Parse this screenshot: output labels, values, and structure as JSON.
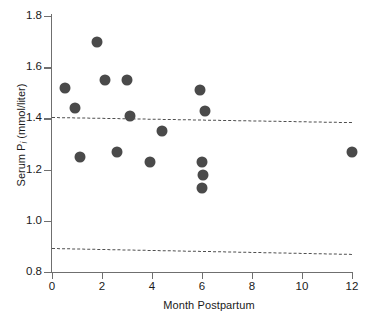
{
  "chart_data": {
    "type": "scatter",
    "title": "",
    "xlabel": "Month Postpartum",
    "ylabel": "Serum Pi (mmol/liter)",
    "ylabel_main": "Serum P",
    "ylabel_sub": "i",
    "ylabel_unit": " (mmol/liter)",
    "xlim": [
      0,
      12
    ],
    "ylim": [
      0.8,
      1.8
    ],
    "xticks": [
      0,
      2,
      4,
      6,
      8,
      10,
      12
    ],
    "xtick_labels": [
      "0",
      "2",
      "4",
      "6",
      "8",
      "10",
      "12"
    ],
    "yticks": [
      0.8,
      1.0,
      1.2,
      1.4,
      1.6,
      1.8
    ],
    "ytick_labels": [
      "0.8",
      "1.0",
      "1.2",
      "1.4",
      "1.6",
      "1.8"
    ],
    "grid": false,
    "legend": "none",
    "marker": {
      "shape": "circle",
      "color": "#4a4a4a",
      "size": 11
    },
    "points": [
      {
        "x": 0.5,
        "y": 1.52
      },
      {
        "x": 0.9,
        "y": 1.44
      },
      {
        "x": 1.1,
        "y": 1.25
      },
      {
        "x": 1.8,
        "y": 1.7
      },
      {
        "x": 2.1,
        "y": 1.55
      },
      {
        "x": 2.6,
        "y": 1.27
      },
      {
        "x": 3.0,
        "y": 1.55
      },
      {
        "x": 3.1,
        "y": 1.41
      },
      {
        "x": 3.9,
        "y": 1.23
      },
      {
        "x": 4.4,
        "y": 1.35
      },
      {
        "x": 5.9,
        "y": 1.51
      },
      {
        "x": 6.1,
        "y": 1.43
      },
      {
        "x": 6.0,
        "y": 1.23
      },
      {
        "x": 6.05,
        "y": 1.18
      },
      {
        "x": 6.0,
        "y": 1.13
      },
      {
        "x": 12.0,
        "y": 1.27
      }
    ],
    "reference_lines": [
      {
        "name": "upper-limit",
        "y_left": 1.405,
        "y_right": 1.385,
        "style": "dashed",
        "color": "#4f4f4f"
      },
      {
        "name": "lower-limit",
        "y_left": 0.895,
        "y_right": 0.872,
        "style": "dashed",
        "color": "#4f4f4f"
      }
    ]
  }
}
